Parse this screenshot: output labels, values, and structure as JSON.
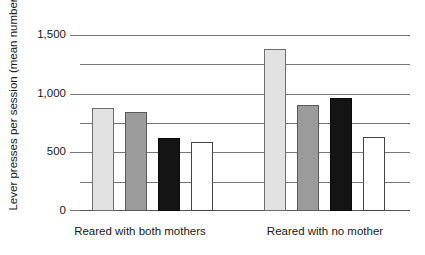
{
  "chart_data": {
    "type": "bar",
    "title": "",
    "xlabel": "",
    "ylabel": "Lever presses per session (mean number)",
    "ylim": [
      0,
      1500
    ],
    "ytick_values": [
      0,
      250,
      500,
      750,
      1000,
      1250,
      1500
    ],
    "ytick_labels": [
      "0",
      "",
      "500",
      "",
      "1,000",
      "",
      "1,500"
    ],
    "grid": true,
    "legend": "none",
    "categories": [
      "Reared with both mothers",
      "Reared with no mother"
    ],
    "series": [
      {
        "name": "bar-1",
        "fill": "light",
        "values": [
          880,
          1390
        ]
      },
      {
        "name": "bar-2",
        "fill": "mid",
        "values": [
          845,
          910
        ]
      },
      {
        "name": "bar-3",
        "fill": "dark",
        "values": [
          625,
          970
        ]
      },
      {
        "name": "bar-4",
        "fill": "white",
        "values": [
          590,
          635
        ]
      }
    ],
    "bars": [
      {
        "id": "g1-b1",
        "group": 0,
        "index": 0,
        "value": 880,
        "fill": "light"
      },
      {
        "id": "g1-b2",
        "group": 0,
        "index": 1,
        "value": 845,
        "fill": "mid"
      },
      {
        "id": "g1-b3",
        "group": 0,
        "index": 2,
        "value": 625,
        "fill": "dark"
      },
      {
        "id": "g1-b4",
        "group": 0,
        "index": 3,
        "value": 590,
        "fill": "white"
      },
      {
        "id": "g2-b1",
        "group": 1,
        "index": 0,
        "value": 1390,
        "fill": "light"
      },
      {
        "id": "g2-b2",
        "group": 1,
        "index": 1,
        "value": 910,
        "fill": "mid"
      },
      {
        "id": "g2-b3",
        "group": 1,
        "index": 2,
        "value": 970,
        "fill": "dark"
      },
      {
        "id": "g2-b4",
        "group": 1,
        "index": 3,
        "value": 635,
        "fill": "white"
      }
    ],
    "colors": {
      "light": "#e2e2e2",
      "mid": "#9b9b9b",
      "dark": "#141414",
      "white": "#ffffff",
      "gridline": "#777777",
      "text": "#1a1a1a"
    }
  },
  "axis": {
    "y_title": "Lever presses per session (mean number)",
    "labels": {
      "t0": "0",
      "t500": "500",
      "t1000": "1,000",
      "t1500": "1,500"
    }
  },
  "categories": {
    "group1": "Reared with both mothers",
    "group2": "Reared with no mother"
  }
}
